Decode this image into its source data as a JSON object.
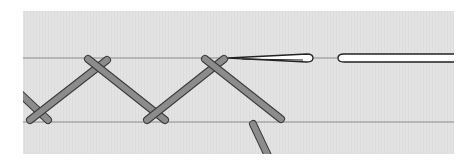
{
  "diagram": {
    "type": "herringbone-stitch-illustration",
    "colors": {
      "page_background": "#ffffff",
      "fabric": "#e3e3e3",
      "guide_line": "#8a8a8a",
      "thread_fill": "#8c8c8c",
      "thread_outline": "#3a3a3a",
      "needle_fill": "#ffffff",
      "needle_outline": "#222222"
    },
    "fabric_panel": {
      "x": 23,
      "y": 11,
      "width": 431,
      "height": 143
    },
    "guide_lines": [
      {
        "name": "top-guide-line",
        "y": 58
      },
      {
        "name": "bottom-guide-line",
        "y": 122
      }
    ],
    "stitches": [
      {
        "name": "stitch-partial-left",
        "x1": 14,
        "y1": 88,
        "x2": 48,
        "y2": 120
      },
      {
        "name": "stitch-1-up",
        "x1": 30,
        "y1": 120,
        "x2": 107,
        "y2": 60
      },
      {
        "name": "stitch-2-down",
        "x1": 88,
        "y1": 59,
        "x2": 165,
        "y2": 120
      },
      {
        "name": "stitch-3-up",
        "x1": 147,
        "y1": 120,
        "x2": 224,
        "y2": 59
      },
      {
        "name": "stitch-4-down",
        "x1": 205,
        "y1": 59,
        "x2": 281,
        "y2": 119
      },
      {
        "name": "stitch-5-emerging",
        "x1": 253,
        "y1": 124,
        "x2": 270,
        "y2": 160
      }
    ],
    "needle": {
      "tip_x": 228,
      "y": 58,
      "eye_start_x": 311,
      "eye_end_x": 340,
      "end_x": 454
    }
  }
}
